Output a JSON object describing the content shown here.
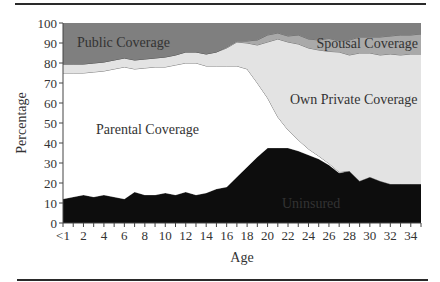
{
  "chart_data": {
    "type": "area",
    "stacked": true,
    "title": "",
    "xlabel": "Age",
    "ylabel": "Percentage",
    "ylim": [
      0,
      100
    ],
    "xlim": [
      0,
      35
    ],
    "grid": false,
    "legend": "inline labels",
    "y_ticks": [
      "0",
      "10",
      "20",
      "30",
      "40",
      "50",
      "60",
      "70",
      "80",
      "90",
      "100"
    ],
    "x_tick_labels": [
      "<1",
      "2",
      "4",
      "6",
      "8",
      "10",
      "12",
      "14",
      "16",
      "18",
      "20",
      "22",
      "24",
      "26",
      "28",
      "30",
      "32",
      "34"
    ],
    "x": [
      0,
      1,
      2,
      3,
      4,
      5,
      6,
      7,
      8,
      9,
      10,
      11,
      12,
      13,
      14,
      15,
      16,
      17,
      18,
      19,
      20,
      21,
      22,
      23,
      24,
      25,
      26,
      27,
      28,
      29,
      30,
      31,
      32,
      33,
      34,
      35
    ],
    "series": [
      {
        "name": "Uninsured",
        "color": "#0d0d0d",
        "label_color": "#e8e8e8",
        "values": [
          12,
          13,
          14,
          13,
          14,
          13,
          12,
          15.5,
          14,
          14,
          15,
          14,
          15.5,
          14,
          15,
          17,
          18,
          23,
          28,
          33,
          37.5,
          37.5,
          37.5,
          36,
          34,
          32,
          29,
          25,
          26,
          21,
          23,
          21,
          19.5,
          19.5,
          19.5,
          19.5
        ]
      },
      {
        "name": "Parental Coverage",
        "color": "#ffffff",
        "label_color": "#333333",
        "values": [
          63,
          62,
          61,
          62.5,
          62,
          64,
          66,
          61.5,
          63.5,
          64,
          63,
          65,
          64.5,
          66,
          63.5,
          61.5,
          60.5,
          55.5,
          49,
          37,
          25,
          15.5,
          9,
          5.5,
          3,
          1.5,
          0.8,
          0.5,
          0,
          0,
          0,
          0,
          0,
          0,
          0,
          0
        ]
      },
      {
        "name": "Own Private Coverage",
        "color": "#e3e3e3",
        "label_color": "#333333",
        "values": [
          4.5,
          4.5,
          4.5,
          4.5,
          4.5,
          4.5,
          4.5,
          4.5,
          4.5,
          4.5,
          5,
          5,
          5.5,
          5.5,
          6,
          7,
          9,
          12,
          13,
          19,
          28,
          39,
          44,
          48,
          50.5,
          53,
          56,
          60,
          58,
          64,
          62,
          63,
          65,
          64.5,
          65,
          65
        ]
      },
      {
        "name": "Spousal Coverage",
        "color": "#a9a9a9",
        "label_color": "#333333",
        "values": [
          0,
          0,
          0,
          0,
          0,
          0,
          0,
          0,
          0,
          0,
          0,
          0,
          0,
          0,
          0,
          0,
          0.5,
          0.5,
          1,
          2.5,
          3.5,
          3,
          3,
          4.5,
          4.5,
          5,
          6.5,
          5.5,
          7.5,
          8,
          8,
          9,
          9,
          10,
          9.5,
          10
        ]
      },
      {
        "name": "Public Coverage",
        "color": "#7f7f7f",
        "label_color": "#333333",
        "values": [
          20.5,
          20.5,
          20.5,
          20,
          19.5,
          18.5,
          17.5,
          18.5,
          18,
          17.5,
          17,
          16,
          14.5,
          14.5,
          15.5,
          14.5,
          12,
          9,
          9,
          8.5,
          6,
          5,
          6.5,
          6,
          8,
          8.5,
          8.5,
          9,
          8.5,
          7,
          7,
          7,
          6.5,
          6,
          6,
          5.5
        ]
      }
    ],
    "annotations": [
      {
        "text": "Public Coverage",
        "series": "Public Coverage"
      },
      {
        "text": "Spousal Coverage",
        "series": "Spousal Coverage"
      },
      {
        "text": "Own Private Coverage",
        "series": "Own Private Coverage"
      },
      {
        "text": "Parental Coverage",
        "series": "Parental Coverage"
      },
      {
        "text": "Uninsured",
        "series": "Uninsured"
      }
    ]
  },
  "labels": {
    "public": "Public Coverage",
    "spousal": "Spousal Coverage",
    "own_private": "Own Private Coverage",
    "parental": "Parental Coverage",
    "uninsured": "Uninsured",
    "x_axis": "Age",
    "y_axis": "Percentage"
  }
}
